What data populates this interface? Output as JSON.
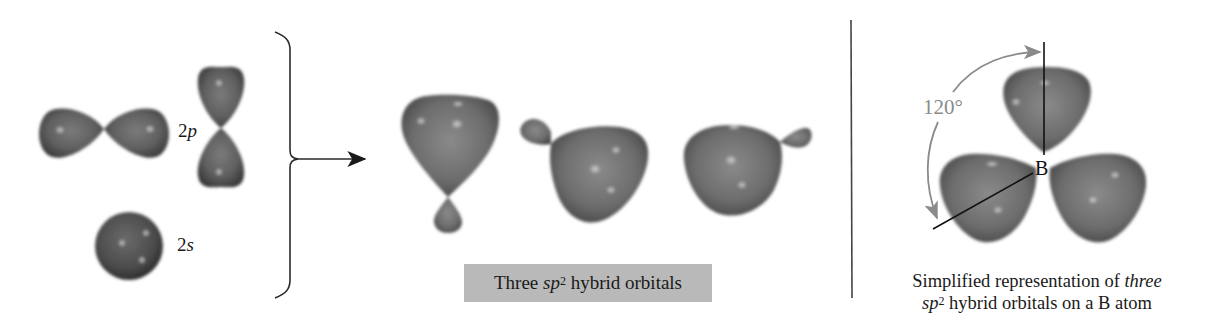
{
  "figure": {
    "left_panel": {
      "orbital_p_label": {
        "prefix": "2",
        "italic": "p"
      },
      "orbital_s_label": {
        "prefix": "2",
        "italic": "s"
      }
    },
    "middle_panel": {
      "caption": {
        "before": "Three ",
        "italic": "sp",
        "sup": "2",
        "after": " hybrid orbitals"
      }
    },
    "right_panel": {
      "angle_label": "120°",
      "atom_label": "B",
      "caption_line1": {
        "before": "Simplified representation of ",
        "italic": "three"
      },
      "caption_line2": {
        "italic": "sp",
        "sup": "2",
        "after": " hybrid orbitals on a B atom"
      }
    },
    "colors": {
      "orbital_dark": "#3f3f3f",
      "orbital_mid": "#6e6e6e",
      "orbital_highlight": "#c8c8c8",
      "caption_box_bg": "#b9b9b9",
      "angle_arrow": "#8a8a8a",
      "line": "#222222"
    }
  }
}
